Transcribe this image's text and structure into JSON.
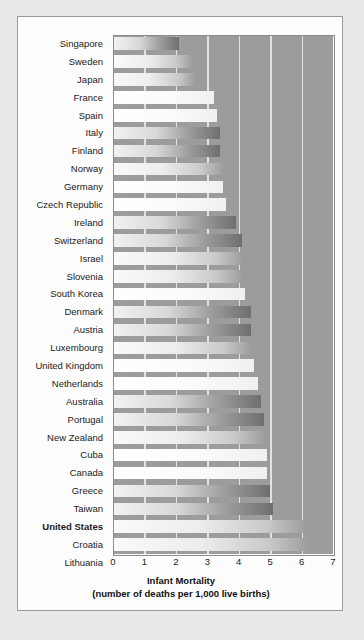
{
  "chart_data": {
    "type": "bar",
    "orientation": "horizontal",
    "title": "",
    "xlabel": "Infant Mortality",
    "xlabel_sub": "(number of deaths per 1,000 live births)",
    "ylabel": "",
    "xlim": [
      0,
      7
    ],
    "xticks": [
      "0",
      "1",
      "2",
      "3",
      "4",
      "5",
      "6",
      "7"
    ],
    "grid": "vertical-white",
    "legend": "none",
    "highlight": "United States",
    "categories": [
      "Singapore",
      "Sweden",
      "Japan",
      "France",
      "Spain",
      "Italy",
      "Finland",
      "Norway",
      "Germany",
      "Czech Republic",
      "Ireland",
      "Switzerland",
      "Israel",
      "Slovenia",
      "South Korea",
      "Denmark",
      "Austria",
      "Luxembourg",
      "United Kingdom",
      "Netherlands",
      "Australia",
      "Portugal",
      "New Zealand",
      "Cuba",
      "Canada",
      "Greece",
      "Taiwan",
      "United States",
      "Croatia",
      "Lithuania"
    ],
    "values": [
      2.1,
      2.5,
      2.6,
      3.2,
      3.3,
      3.4,
      3.4,
      3.5,
      3.5,
      3.6,
      3.9,
      4.1,
      4.1,
      4.1,
      4.2,
      4.4,
      4.4,
      4.4,
      4.5,
      4.6,
      4.7,
      4.8,
      4.8,
      4.9,
      4.9,
      5.0,
      5.1,
      6.1,
      6.2,
      6.3
    ],
    "bar_styles": [
      "dark",
      "plain",
      "plain",
      "light",
      "light",
      "dark",
      "dark",
      "plain",
      "light",
      "light",
      "dark",
      "dark",
      "plain",
      "plain",
      "light",
      "dark",
      "dark",
      "plain",
      "light",
      "light",
      "dark",
      "dark",
      "plain",
      "light",
      "light",
      "dark",
      "dark",
      "plain",
      "plain",
      "plain"
    ]
  },
  "colors": {
    "page_background": "#e9e9e9",
    "panel_background": "#fdfdfd",
    "plot_background": "#9c9c9c",
    "gridline": "#efefef",
    "text": "#1b1b1b",
    "panel_border": "#9a9a9a"
  }
}
